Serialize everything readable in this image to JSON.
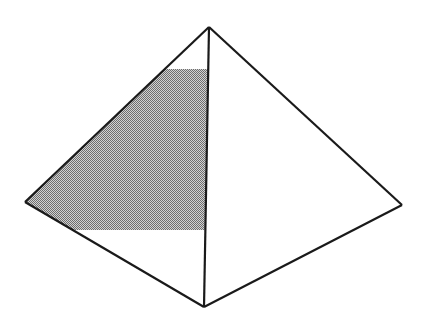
{
  "figure": {
    "name": "pyramid-line-diagram",
    "canvas": {
      "width": 428,
      "height": 328,
      "background": "#ffffff"
    },
    "stroke": {
      "color": "#1a1a1a",
      "width": 2.2,
      "join": "miter"
    },
    "shading": {
      "name": "left-face-band",
      "fill": "#9a9a9a",
      "pattern": "50-percent-checkerboard-dither",
      "pattern_dark": "#6e6e6e",
      "pattern_light": "#d2d2d2",
      "description": "Horizontal band across the left (front-left) face between y=69 and y=230"
    },
    "vertices": {
      "apex": {
        "label": "apex",
        "x": 209,
        "y": 27
      },
      "left": {
        "label": "left-base-corner",
        "x": 25,
        "y": 202
      },
      "right": {
        "label": "right-base-corner",
        "x": 402,
        "y": 205
      },
      "front": {
        "label": "front-base-corner",
        "x": 204,
        "y": 307
      }
    },
    "edges": [
      {
        "name": "apex-to-left-edge",
        "from": "apex",
        "to": "left"
      },
      {
        "name": "apex-to-right-edge",
        "from": "apex",
        "to": "right"
      },
      {
        "name": "apex-to-front-ridge-edge",
        "from": "apex",
        "to": "front"
      },
      {
        "name": "left-to-front-base-edge",
        "from": "left",
        "to": "front"
      },
      {
        "name": "front-to-right-base-edge",
        "from": "front",
        "to": "right"
      }
    ],
    "faces": [
      {
        "name": "left-face",
        "vertices": [
          "apex",
          "left",
          "front"
        ],
        "fill": "#ffffff"
      },
      {
        "name": "right-face",
        "vertices": [
          "apex",
          "front",
          "right"
        ],
        "fill": "#ffffff"
      }
    ],
    "band": {
      "name": "shaded-band",
      "top_y": 69,
      "bottom_y": 230,
      "top_left_x": 172,
      "top_right_x": 207,
      "bottom_left_x": 73,
      "bottom_right_x": 205,
      "polygon": "172,69 207,69 205,230 73,230"
    }
  }
}
